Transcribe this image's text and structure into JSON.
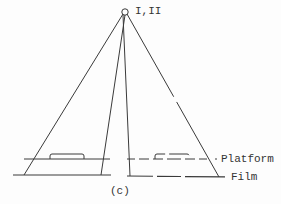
{
  "diagram": {
    "source_label": "I,II",
    "platform_label": "Platform",
    "film_label": "Film",
    "caption": "(c)",
    "stroke_color": "#3a3a3a"
  }
}
